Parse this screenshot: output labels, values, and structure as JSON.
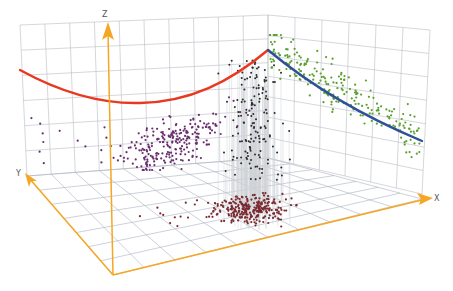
{
  "chart_data": {
    "type": "scatter3d",
    "title": "",
    "axes": {
      "x": {
        "label": "X"
      },
      "y": {
        "label": "Y"
      },
      "z": {
        "label": "Z"
      }
    },
    "grid": true,
    "legend": null,
    "axis_color": "#f5a623",
    "grid_color": "#b8bcc4",
    "series": [
      {
        "name": "purple-cluster",
        "color": "#6a2f6e",
        "projection": "back-left wall (X-Z plane)",
        "approx_points": 260
      },
      {
        "name": "green-cluster",
        "color": "#5aa02c",
        "projection": "right wall (Y-Z plane)",
        "approx_points": 220
      },
      {
        "name": "dark-red-cluster",
        "color": "#7a2a30",
        "projection": "floor (X-Y plane)",
        "approx_points": 280
      },
      {
        "name": "black-points-with-drop-lines",
        "color": "#2b2b2b",
        "projection": "3D volume with vertical drop lines to floor",
        "approx_points": 150
      }
    ],
    "curves": [
      {
        "name": "red-fit-curve",
        "color": "#e8381f",
        "plane": "X-Z wall",
        "shape": "U-shaped parabola, minimum near left-center, rising to back corner"
      },
      {
        "name": "blue-fit-curve",
        "color": "#2e4f9a",
        "plane": "Y-Z wall",
        "shape": "decreasing convex curve from back corner to right edge"
      }
    ]
  },
  "labels": {
    "x": "X",
    "y": "Y",
    "z": "Z"
  }
}
